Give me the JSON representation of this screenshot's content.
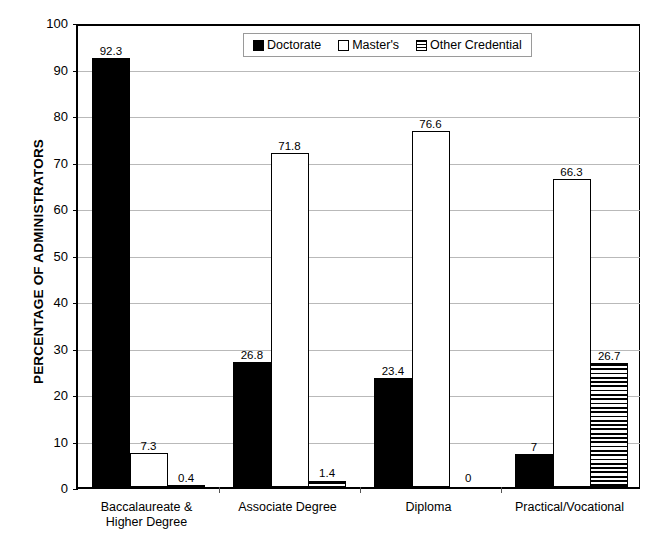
{
  "chart_data": {
    "type": "bar",
    "title": "",
    "xlabel": "",
    "ylabel": "PERCENTAGE OF ADMINISTRATORS",
    "ylim": [
      0,
      100
    ],
    "ytick_step": 10,
    "yticks": [
      "100",
      "90",
      "80",
      "70",
      "60",
      "50",
      "40",
      "30",
      "20",
      "10",
      "0"
    ],
    "grid": true,
    "legend_position": "top-center",
    "categories": [
      "Baccalaureate &\nHigher Degree",
      "Associate Degree",
      "Diploma",
      "Practical/Vocational"
    ],
    "category_lines": [
      [
        "Baccalaureate &",
        "Higher Degree"
      ],
      [
        "Associate Degree"
      ],
      [
        "Diploma"
      ],
      [
        "Practical/Vocational"
      ]
    ],
    "series": [
      {
        "name": "Doctorate",
        "fill": "solid-black",
        "color": "#000000",
        "values": [
          92.3,
          26.8,
          23.4,
          7
        ],
        "labels": [
          "92.3",
          "26.8",
          "23.4",
          "7"
        ]
      },
      {
        "name": "Master's",
        "fill": "white-outline",
        "color": "#ffffff",
        "values": [
          7.3,
          71.8,
          76.6,
          66.3
        ],
        "labels": [
          "7.3",
          "71.8",
          "76.6",
          "66.3"
        ]
      },
      {
        "name": "Other Credential",
        "fill": "horizontal-stripes",
        "color": "#ffffff",
        "values": [
          0.4,
          1.4,
          0,
          26.7
        ],
        "labels": [
          "0.4",
          "1.4",
          "0",
          "26.7"
        ]
      }
    ]
  },
  "legend": {
    "items": [
      {
        "label": "Doctorate",
        "swatch": "solid-black-swatch"
      },
      {
        "label": "Master's",
        "swatch": "white-outline-swatch"
      },
      {
        "label": "Other Credential",
        "swatch": "striped-swatch"
      }
    ]
  },
  "axis": {
    "y_title": "PERCENTAGE OF ADMINISTRATORS"
  }
}
